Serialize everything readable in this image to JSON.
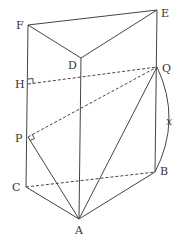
{
  "figure": {
    "type": "triangular-prism-geometry",
    "labels": {
      "F": "F",
      "D": "D",
      "E": "E",
      "H": "H",
      "Q": "Q",
      "P": "P",
      "C": "C",
      "B": "B",
      "A": "A",
      "x": "x"
    },
    "points": {
      "F": [
        28,
        25
      ],
      "E": [
        157,
        10
      ],
      "D": [
        81,
        58
      ],
      "H": [
        28,
        84
      ],
      "Q": [
        157,
        67
      ],
      "P": [
        28,
        137
      ],
      "C": [
        26,
        187
      ],
      "B": [
        155,
        172
      ],
      "A": [
        79,
        219
      ]
    },
    "solid_edges": [
      [
        "F",
        "E"
      ],
      [
        "F",
        "D"
      ],
      [
        "D",
        "E"
      ],
      [
        "F",
        "C"
      ],
      [
        "D",
        "A"
      ],
      [
        "E",
        "B"
      ],
      [
        "C",
        "A"
      ],
      [
        "A",
        "B"
      ],
      [
        "A",
        "Q"
      ],
      [
        "A",
        "P"
      ]
    ],
    "dashed_edges": [
      [
        "H",
        "Q"
      ],
      [
        "P",
        "Q"
      ],
      [
        "C",
        "B"
      ]
    ],
    "right_angles": [
      "H",
      "P"
    ],
    "arc": {
      "from": "Q",
      "to": "B",
      "label": "x"
    }
  }
}
